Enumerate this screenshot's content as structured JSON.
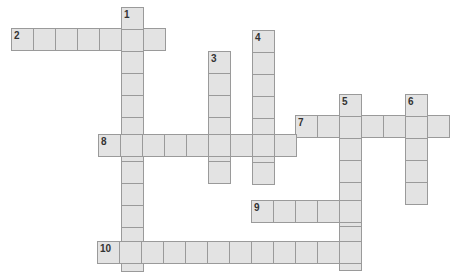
{
  "puzzle": {
    "type": "crossword",
    "cell_size": 22,
    "colors": {
      "cell_fill": "#e3e3e3",
      "cell_border": "#9a9a9a",
      "number": "#333333",
      "background": "#ffffff"
    },
    "words": [
      {
        "number": "1",
        "direction": "down",
        "x": 121,
        "y": 7,
        "length": 12
      },
      {
        "number": "2",
        "direction": "across",
        "x": 11,
        "y": 28,
        "length": 7
      },
      {
        "number": "3",
        "direction": "down",
        "x": 208,
        "y": 51,
        "length": 6
      },
      {
        "number": "4",
        "direction": "down",
        "x": 252,
        "y": 30,
        "length": 7
      },
      {
        "number": "5",
        "direction": "down",
        "x": 339,
        "y": 94,
        "length": 8
      },
      {
        "number": "6",
        "direction": "down",
        "x": 405,
        "y": 94,
        "length": 5
      },
      {
        "number": "7",
        "direction": "across",
        "x": 295,
        "y": 115,
        "length": 7
      },
      {
        "number": "8",
        "direction": "across",
        "x": 98,
        "y": 134,
        "length": 9
      },
      {
        "number": "9",
        "direction": "across",
        "x": 251,
        "y": 200,
        "length": 5
      },
      {
        "number": "10",
        "direction": "across",
        "x": 97,
        "y": 241,
        "length": 12
      }
    ]
  }
}
